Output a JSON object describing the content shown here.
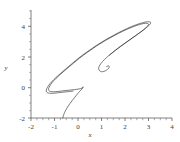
{
  "chart_data": {
    "type": "line",
    "title": "",
    "subtitle": "",
    "xlabel": "x",
    "ylabel": "y",
    "xlim": [
      -2,
      4
    ],
    "ylim": [
      -2,
      5
    ],
    "xticks": [
      -2,
      -1,
      0,
      1,
      2,
      3,
      4
    ],
    "xticklabels": [
      "-2",
      "-1",
      "0",
      "1",
      "2",
      "3",
      "4"
    ],
    "yticks": [
      -2,
      0,
      2,
      4
    ],
    "yticklabels": [
      "-2",
      "0",
      "2",
      "4"
    ],
    "grid": false,
    "legend": null,
    "annotations": [],
    "series": [
      {
        "name": "trajectory",
        "color": "#2b2b2b",
        "x": [
          1.22,
          1.3,
          1.33,
          1.3,
          1.21,
          1.1,
          1.0,
          0.92,
          0.88,
          0.9,
          0.98,
          1.12,
          1.32,
          1.56,
          1.82,
          2.08,
          2.32,
          2.54,
          2.72,
          2.86,
          2.96,
          3.0,
          2.98,
          2.88,
          2.72,
          2.5,
          2.22,
          1.9,
          1.54,
          1.16,
          0.78,
          0.42,
          0.08,
          -0.22,
          -0.5,
          -0.74,
          -0.94,
          -1.1,
          -1.2,
          -1.25,
          -1.24,
          -1.17,
          -1.04,
          -0.86,
          -0.64,
          -0.4,
          -0.16,
          0.04,
          0.18,
          0.22,
          0.16,
          0.02,
          -0.16,
          -0.34,
          -0.48,
          -0.57,
          -0.62,
          -0.65
        ],
        "y": [
          1.34,
          1.38,
          1.33,
          1.22,
          1.1,
          1.02,
          1.0,
          1.06,
          1.18,
          1.34,
          1.54,
          1.78,
          2.06,
          2.36,
          2.66,
          2.94,
          3.2,
          3.44,
          3.64,
          3.82,
          3.96,
          4.06,
          4.12,
          4.14,
          4.1,
          4.0,
          3.84,
          3.62,
          3.34,
          3.02,
          2.66,
          2.28,
          1.9,
          1.52,
          1.16,
          0.84,
          0.56,
          0.3,
          0.08,
          -0.1,
          -0.22,
          -0.28,
          -0.3,
          -0.28,
          -0.24,
          -0.2,
          -0.16,
          -0.12,
          -0.06,
          0.02,
          -0.14,
          -0.36,
          -0.7,
          -1.06,
          -1.38,
          -1.64,
          -1.84,
          -2.0
        ]
      }
    ]
  },
  "axes": {
    "x_axis_name": "x-axis",
    "y_axis_name": "y-axis"
  }
}
